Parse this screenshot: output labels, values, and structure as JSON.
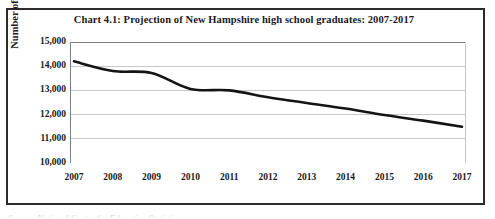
{
  "chart_data": {
    "type": "line",
    "title": "Chart 4.1: Projection of New Hampshire high school graduates: 2007-2017",
    "xlabel": "",
    "ylabel": "Number of graduates",
    "categories": [
      "2007",
      "2008",
      "2009",
      "2010",
      "2011",
      "2012",
      "2013",
      "2014",
      "2015",
      "2016",
      "2017"
    ],
    "values": [
      14200,
      13800,
      13720,
      13060,
      13000,
      12720,
      12480,
      12250,
      11980,
      11750,
      11500
    ],
    "series": [
      {
        "name": "New Hampshire high school graduates",
        "values": [
          14200,
          13800,
          13720,
          13060,
          13000,
          12720,
          12480,
          12250,
          11980,
          11750,
          11500
        ]
      }
    ],
    "ylim": [
      10000,
      15000
    ],
    "ytick_labels": [
      "15,000",
      "14,000",
      "13,000",
      "12,000",
      "11,000",
      "10,000"
    ],
    "ytick_values": [
      15000,
      14000,
      13000,
      12000,
      11000,
      10000
    ],
    "grid": true,
    "legend": "none",
    "line_color": "#141414",
    "grid_color": "#c8c8c8",
    "axis_color": "#808080",
    "frame_color": "#2b2b2b",
    "background": "#ffffff"
  },
  "footer": {
    "clipped_text": "Source: National Center for Education Statistics"
  }
}
